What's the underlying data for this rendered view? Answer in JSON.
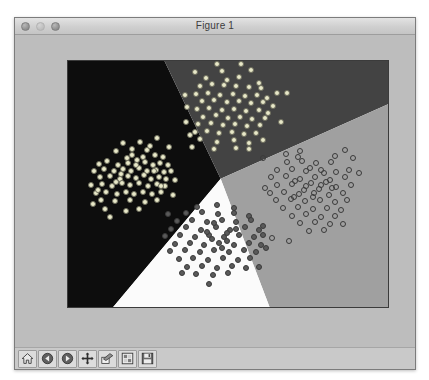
{
  "window": {
    "title": "Figure 1",
    "traffic_lights": [
      {
        "name": "close-button",
        "state": "inactive"
      },
      {
        "name": "minimize-button",
        "state": "inactive"
      },
      {
        "name": "zoom-button",
        "state": "inactive"
      }
    ]
  },
  "toolbar": {
    "buttons": [
      {
        "name": "home-icon",
        "label": "Home"
      },
      {
        "name": "back-arrow-icon",
        "label": "Back"
      },
      {
        "name": "forward-arrow-icon",
        "label": "Forward"
      },
      {
        "name": "pan-move-icon",
        "label": "Pan"
      },
      {
        "name": "zoom-rect-icon",
        "label": "Zoom to rectangle"
      },
      {
        "name": "configure-subplots-icon",
        "label": "Configure subplots"
      },
      {
        "name": "save-disk-icon",
        "label": "Save the figure"
      }
    ]
  },
  "chart_data": {
    "type": "scatter",
    "title": "",
    "xlabel": "",
    "ylabel": "",
    "xlim": [
      -1.9,
      11.2
    ],
    "ylim": [
      -4.4,
      7.0
    ],
    "xticks": [
      -1,
      0,
      1,
      2,
      3,
      4,
      5,
      6,
      7,
      8,
      9,
      10
    ],
    "yticks": [
      -4,
      -3,
      -2,
      -1,
      0,
      1,
      2,
      3,
      4,
      5,
      6
    ],
    "grid": false,
    "legend": null,
    "background_regions": [
      {
        "name": "region-class-0",
        "color": "#0d0d0d",
        "label": "class 0 decision region (left)"
      },
      {
        "name": "region-class-1",
        "color": "#434343",
        "label": "class 1 decision region (top)"
      },
      {
        "name": "region-class-2",
        "color": "#a0a0a0",
        "label": "class 2 decision region (right)"
      },
      {
        "name": "region-class-3",
        "color": "#fbfbfb",
        "label": "class 3 decision region (bottom)"
      }
    ],
    "series": [
      {
        "name": "cluster-left",
        "marker": "filled-light",
        "color": "#e8e8c8",
        "edge": "#6d6d5c",
        "center": [
          1.0,
          2.0
        ],
        "points": [
          [
            0.06,
            2.85
          ],
          [
            0.33,
            3.25
          ],
          [
            1.04,
            3.3
          ],
          [
            1.72,
            3.45
          ],
          [
            2.19,
            3.05
          ],
          [
            0.5,
            2.55
          ],
          [
            0.72,
            2.95
          ],
          [
            1.3,
            2.9
          ],
          [
            1.62,
            2.7
          ],
          [
            1.95,
            2.6
          ],
          [
            -0.65,
            2.25
          ],
          [
            -0.3,
            2.4
          ],
          [
            0.15,
            2.2
          ],
          [
            0.52,
            2.3
          ],
          [
            0.9,
            2.45
          ],
          [
            1.25,
            2.35
          ],
          [
            1.55,
            2.2
          ],
          [
            1.85,
            2.3
          ],
          [
            2.15,
            2.2
          ],
          [
            -0.85,
            1.95
          ],
          [
            -0.45,
            2.05
          ],
          [
            -0.05,
            1.95
          ],
          [
            0.35,
            2.05
          ],
          [
            0.68,
            1.95
          ],
          [
            1.0,
            2.1
          ],
          [
            1.32,
            1.95
          ],
          [
            1.68,
            2.0
          ],
          [
            2.0,
            1.9
          ],
          [
            2.3,
            1.95
          ],
          [
            -0.6,
            1.65
          ],
          [
            -0.2,
            1.7
          ],
          [
            0.2,
            1.6
          ],
          [
            0.55,
            1.72
          ],
          [
            0.88,
            1.62
          ],
          [
            1.18,
            1.75
          ],
          [
            1.48,
            1.6
          ],
          [
            1.78,
            1.68
          ],
          [
            2.08,
            1.6
          ],
          [
            -0.95,
            1.3
          ],
          [
            -0.5,
            1.35
          ],
          [
            -0.12,
            1.25
          ],
          [
            0.28,
            1.38
          ],
          [
            0.62,
            1.28
          ],
          [
            0.98,
            1.4
          ],
          [
            1.35,
            1.25
          ],
          [
            1.7,
            1.35
          ],
          [
            2.05,
            1.25
          ],
          [
            -0.75,
            0.95
          ],
          [
            -0.35,
            1.0
          ],
          [
            0.08,
            0.9
          ],
          [
            0.45,
            1.0
          ],
          [
            0.8,
            0.88
          ],
          [
            1.15,
            1.0
          ],
          [
            1.5,
            0.9
          ],
          [
            1.88,
            0.98
          ],
          [
            -0.55,
            0.6
          ],
          [
            0.0,
            0.55
          ],
          [
            0.62,
            0.6
          ],
          [
            1.25,
            0.5
          ],
          [
            1.72,
            0.62
          ],
          [
            -0.4,
            0.2
          ],
          [
            0.45,
            0.1
          ],
          [
            1.0,
            0.2
          ],
          [
            -0.9,
            0.45
          ],
          [
            2.35,
            0.85
          ],
          [
            2.45,
            1.55
          ],
          [
            -0.2,
            -0.15
          ],
          [
            0.72,
            2.68
          ],
          [
            1.45,
            3.1
          ],
          [
            -0.7,
            1.05
          ],
          [
            0.25,
            1.8
          ],
          [
            1.15,
            2.6
          ],
          [
            1.9,
            1.25
          ],
          [
            0.05,
            1.45
          ],
          [
            0.85,
            2.2
          ],
          [
            1.6,
            1.95
          ]
        ]
      },
      {
        "name": "cluster-top",
        "marker": "filled-light",
        "color": "#e8e8c8",
        "edge": "#6d6d5c",
        "center": [
          4.6,
          5.2
        ],
        "points": [
          [
            3.25,
            6.5
          ],
          [
            4.35,
            6.55
          ],
          [
            5.55,
            6.6
          ],
          [
            3.7,
            6.2
          ],
          [
            4.55,
            6.15
          ],
          [
            5.05,
            6.25
          ],
          [
            5.85,
            6.0
          ],
          [
            3.45,
            5.85
          ],
          [
            3.95,
            5.95
          ],
          [
            4.45,
            5.9
          ],
          [
            4.95,
            5.85
          ],
          [
            5.45,
            5.8
          ],
          [
            5.95,
            5.75
          ],
          [
            3.3,
            5.5
          ],
          [
            3.8,
            5.55
          ],
          [
            4.3,
            5.45
          ],
          [
            4.8,
            5.5
          ],
          [
            5.3,
            5.4
          ],
          [
            5.8,
            5.45
          ],
          [
            6.2,
            5.3
          ],
          [
            3.55,
            5.15
          ],
          [
            4.05,
            5.2
          ],
          [
            4.55,
            5.1
          ],
          [
            5.05,
            5.15
          ],
          [
            5.55,
            5.05
          ],
          [
            6.05,
            5.1
          ],
          [
            6.45,
            4.95
          ],
          [
            3.35,
            4.8
          ],
          [
            3.85,
            4.85
          ],
          [
            4.35,
            4.75
          ],
          [
            4.85,
            4.8
          ],
          [
            5.35,
            4.7
          ],
          [
            5.85,
            4.75
          ],
          [
            6.25,
            4.6
          ],
          [
            3.6,
            4.45
          ],
          [
            4.1,
            4.5
          ],
          [
            4.6,
            4.4
          ],
          [
            5.1,
            4.45
          ],
          [
            5.6,
            4.35
          ],
          [
            6.1,
            4.4
          ],
          [
            3.4,
            4.1
          ],
          [
            3.9,
            4.15
          ],
          [
            4.4,
            4.05
          ],
          [
            4.9,
            4.1
          ],
          [
            5.4,
            4.0
          ],
          [
            5.9,
            4.05
          ],
          [
            3.25,
            3.75
          ],
          [
            3.75,
            3.8
          ],
          [
            4.25,
            3.7
          ],
          [
            4.75,
            3.75
          ],
          [
            5.25,
            3.65
          ],
          [
            5.75,
            3.7
          ],
          [
            3.45,
            3.4
          ],
          [
            4.15,
            3.3
          ],
          [
            4.85,
            3.35
          ],
          [
            5.45,
            3.25
          ],
          [
            3.05,
            3.6
          ],
          [
            2.95,
            4.9
          ],
          [
            6.6,
            5.55
          ],
          [
            7.0,
            5.55
          ],
          [
            6.75,
            4.2
          ],
          [
            3.15,
            3.05
          ],
          [
            4.05,
            2.95
          ],
          [
            4.95,
            3.0
          ],
          [
            6.05,
            3.35
          ],
          [
            2.85,
            5.45
          ],
          [
            5.15,
            6.85
          ],
          [
            4.15,
            6.85
          ],
          [
            5.45,
            2.95
          ],
          [
            2.9,
            4.2
          ]
        ]
      },
      {
        "name": "cluster-bottom",
        "marker": "filled-dark",
        "color": "#5a5a5a",
        "edge": "#3a3a3a",
        "center": [
          4.2,
          -1.2
        ],
        "points": [
          [
            3.35,
            0.3
          ],
          [
            4.15,
            0.4
          ],
          [
            4.85,
            0.25
          ],
          [
            2.9,
            0.0
          ],
          [
            3.55,
            0.05
          ],
          [
            4.2,
            -0.05
          ],
          [
            4.85,
            0.0
          ],
          [
            5.45,
            -0.1
          ],
          [
            2.55,
            -0.35
          ],
          [
            3.15,
            -0.3
          ],
          [
            3.75,
            -0.4
          ],
          [
            4.35,
            -0.3
          ],
          [
            4.95,
            -0.4
          ],
          [
            5.55,
            -0.3
          ],
          [
            2.3,
            -0.7
          ],
          [
            2.9,
            -0.65
          ],
          [
            3.5,
            -0.75
          ],
          [
            4.1,
            -0.65
          ],
          [
            4.7,
            -0.75
          ],
          [
            5.3,
            -0.65
          ],
          [
            5.85,
            -0.75
          ],
          [
            2.05,
            -1.05
          ],
          [
            2.65,
            -1.0
          ],
          [
            3.25,
            -1.1
          ],
          [
            3.85,
            -1.0
          ],
          [
            4.45,
            -1.1
          ],
          [
            5.05,
            -1.0
          ],
          [
            5.65,
            -1.1
          ],
          [
            6.05,
            -1.0
          ],
          [
            2.45,
            -1.4
          ],
          [
            3.05,
            -1.35
          ],
          [
            3.65,
            -1.45
          ],
          [
            4.25,
            -1.35
          ],
          [
            4.85,
            -1.45
          ],
          [
            5.45,
            -1.35
          ],
          [
            5.95,
            -1.45
          ],
          [
            2.25,
            -1.75
          ],
          [
            2.85,
            -1.7
          ],
          [
            3.45,
            -1.8
          ],
          [
            4.05,
            -1.7
          ],
          [
            4.65,
            -1.8
          ],
          [
            5.25,
            -1.7
          ],
          [
            5.75,
            -1.8
          ],
          [
            2.6,
            -2.1
          ],
          [
            3.2,
            -2.05
          ],
          [
            3.8,
            -2.15
          ],
          [
            4.4,
            -2.05
          ],
          [
            5.0,
            -2.15
          ],
          [
            5.5,
            -2.05
          ],
          [
            2.95,
            -2.45
          ],
          [
            3.55,
            -2.4
          ],
          [
            4.15,
            -2.5
          ],
          [
            4.75,
            -2.4
          ],
          [
            5.35,
            -2.5
          ],
          [
            3.3,
            -2.8
          ],
          [
            4.0,
            -2.85
          ],
          [
            4.6,
            -2.75
          ],
          [
            3.85,
            -3.25
          ],
          [
            4.55,
            -0.9
          ],
          [
            3.95,
            -1.2
          ],
          [
            4.35,
            -1.6
          ],
          [
            4.05,
            -0.45
          ],
          [
            4.55,
            -1.25
          ],
          [
            3.75,
            -0.85
          ],
          [
            4.95,
            -0.7
          ],
          [
            2.75,
            -2.75
          ],
          [
            6.15,
            -1.6
          ],
          [
            6.05,
            -0.6
          ],
          [
            5.85,
            -2.45
          ],
          [
            2.15,
            -0.05
          ]
        ]
      },
      {
        "name": "cluster-right",
        "marker": "open",
        "color": "transparent",
        "edge": "#3a3a3a",
        "center": [
          8.1,
          1.1
        ],
        "points": [
          [
            6.95,
            2.75
          ],
          [
            7.55,
            2.85
          ],
          [
            9.35,
            2.9
          ],
          [
            7.0,
            2.35
          ],
          [
            7.6,
            2.4
          ],
          [
            8.2,
            2.3
          ],
          [
            8.8,
            2.35
          ],
          [
            6.6,
            2.0
          ],
          [
            7.2,
            2.05
          ],
          [
            7.8,
            1.95
          ],
          [
            8.4,
            2.0
          ],
          [
            9.0,
            1.9
          ],
          [
            9.55,
            2.0
          ],
          [
            6.35,
            1.65
          ],
          [
            6.95,
            1.7
          ],
          [
            7.55,
            1.6
          ],
          [
            8.15,
            1.65
          ],
          [
            8.75,
            1.55
          ],
          [
            9.35,
            1.65
          ],
          [
            6.6,
            1.3
          ],
          [
            7.2,
            1.35
          ],
          [
            7.8,
            1.25
          ],
          [
            8.4,
            1.3
          ],
          [
            9.0,
            1.2
          ],
          [
            9.6,
            1.3
          ],
          [
            6.3,
            0.95
          ],
          [
            6.9,
            1.0
          ],
          [
            7.5,
            0.9
          ],
          [
            8.1,
            0.95
          ],
          [
            8.7,
            0.85
          ],
          [
            9.3,
            0.95
          ],
          [
            6.55,
            0.6
          ],
          [
            7.15,
            0.65
          ],
          [
            7.75,
            0.55
          ],
          [
            8.35,
            0.6
          ],
          [
            8.95,
            0.5
          ],
          [
            9.45,
            0.6
          ],
          [
            6.85,
            0.25
          ],
          [
            7.45,
            0.3
          ],
          [
            8.05,
            0.2
          ],
          [
            8.65,
            0.25
          ],
          [
            9.2,
            0.15
          ],
          [
            7.2,
            -0.1
          ],
          [
            7.8,
            -0.05
          ],
          [
            8.4,
            -0.15
          ],
          [
            8.95,
            -0.1
          ],
          [
            7.55,
            -0.45
          ],
          [
            8.15,
            -0.4
          ],
          [
            8.75,
            -0.5
          ],
          [
            7.9,
            -0.8
          ],
          [
            8.5,
            -0.75
          ],
          [
            6.4,
            -1.15
          ],
          [
            7.1,
            -1.25
          ],
          [
            9.3,
            -0.5
          ],
          [
            8.0,
            1.4
          ],
          [
            8.3,
            1.1
          ],
          [
            7.7,
            1.05
          ],
          [
            8.6,
            1.45
          ],
          [
            8.05,
            0.75
          ],
          [
            7.35,
            1.5
          ],
          [
            8.85,
            1.15
          ],
          [
            7.95,
            2.1
          ],
          [
            8.5,
            1.85
          ],
          [
            7.3,
            0.75
          ],
          [
            9.95,
            1.85
          ],
          [
            6.1,
            1.15
          ],
          [
            9.7,
            2.55
          ],
          [
            6.05,
            2.55
          ],
          [
            7.45,
            2.6
          ],
          [
            8.95,
            2.65
          ]
        ]
      }
    ]
  }
}
